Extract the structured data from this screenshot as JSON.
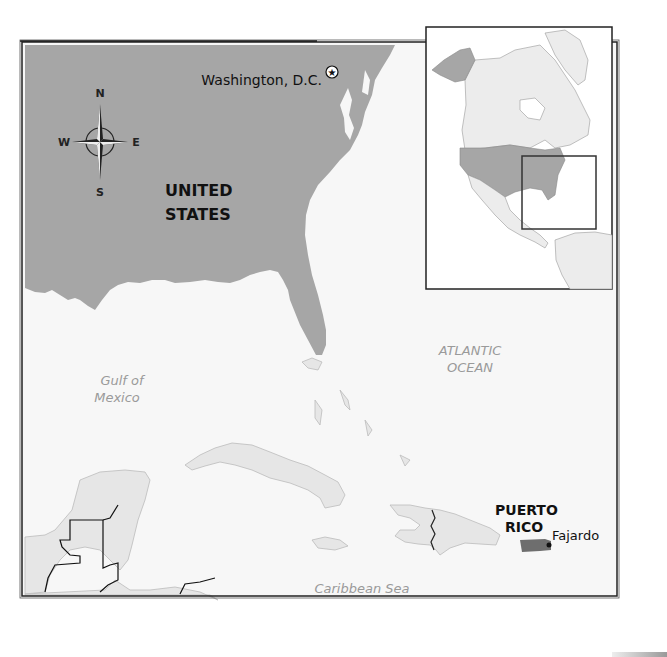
{
  "map": {
    "type": "locator-map",
    "colors": {
      "ocean": "#f7f7f7",
      "us_land": "#a6a6a6",
      "other_land": "#e6e6e6",
      "puerto_rico": "#6e6e6e",
      "water_label": "#9a9a9a",
      "border": "#222222"
    },
    "labels": {
      "country": [
        "UNITED",
        "STATES"
      ],
      "territory": [
        "PUERTO",
        "RICO"
      ],
      "capital": "Washington, D.C.",
      "city": "Fajardo",
      "gulf": [
        "Gulf of",
        "Mexico"
      ],
      "atlantic": [
        "ATLANTIC",
        "OCEAN"
      ],
      "caribbean": "Caribbean Sea"
    },
    "compass": {
      "north": "N",
      "south": "S",
      "east": "E",
      "west": "W"
    },
    "inset": {
      "description": "North America overview with extent rectangle"
    }
  }
}
